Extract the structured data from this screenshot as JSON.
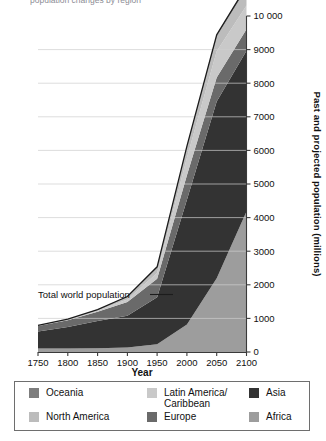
{
  "page": {
    "cut_off_title": "population changes by region"
  },
  "axes": {
    "y_title": "Past and projected population (millions)",
    "x_title": "Year",
    "y_ticks": [
      "0",
      "1000",
      "2000",
      "3000",
      "4000",
      "5000",
      "6000",
      "7000",
      "8000",
      "9000",
      "10 000"
    ],
    "x_ticks": [
      "1750",
      "1800",
      "1850",
      "1900",
      "1950",
      "2000",
      "2050",
      "2100"
    ]
  },
  "annotation": {
    "label": "Total world population",
    "dash": "—"
  },
  "legend": {
    "items": [
      {
        "label": "Oceania",
        "color": "#7d7d7d"
      },
      {
        "label": "Latin America/\nCaribbean",
        "color": "#c9c9c9"
      },
      {
        "label": "Asia",
        "color": "#333333"
      },
      {
        "label": "North America",
        "color": "#bcbcbc"
      },
      {
        "label": "Europe",
        "color": "#6a6a6a"
      },
      {
        "label": "Africa",
        "color": "#9d9d9d"
      }
    ]
  },
  "chart_data": {
    "type": "area",
    "title": "",
    "xlabel": "Year",
    "ylabel": "Past and projected population (millions)",
    "xlim": [
      1750,
      2100
    ],
    "ylim": [
      0,
      10000
    ],
    "grid": true,
    "stacked": true,
    "legend_position": "bottom",
    "x": [
      1750,
      1800,
      1850,
      1900,
      1950,
      2000,
      2050,
      2100
    ],
    "series": [
      {
        "name": "Africa",
        "color": "#9d9d9d",
        "values": [
          106,
          107,
          111,
          133,
          229,
          819,
          2192,
          4185
        ]
      },
      {
        "name": "Asia",
        "color": "#333333",
        "values": [
          502,
          635,
          809,
          947,
          1403,
          3714,
          5267,
          4780
        ]
      },
      {
        "name": "Europe",
        "color": "#6a6a6a",
        "values": [
          163,
          203,
          276,
          408,
          549,
          727,
          707,
          639
        ]
      },
      {
        "name": "Latin America/Caribbean",
        "color": "#c9c9c9",
        "values": [
          16,
          24,
          38,
          74,
          169,
          522,
          784,
          712
        ]
      },
      {
        "name": "North America",
        "color": "#bcbcbc",
        "values": [
          2,
          7,
          26,
          82,
          172,
          313,
          435,
          500
        ]
      },
      {
        "name": "Oceania",
        "color": "#7d7d7d",
        "values": [
          2,
          2,
          2,
          6,
          13,
          31,
          57,
          72
        ]
      }
    ],
    "total_world_population": [
      791,
      978,
      1262,
      1650,
      2535,
      6126,
      9442,
      10888
    ]
  }
}
